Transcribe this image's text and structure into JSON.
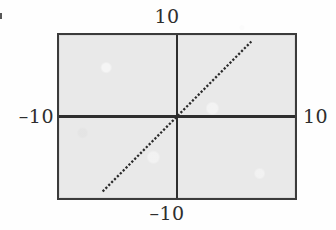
{
  "figure": {
    "kind": "cartesian-line-plot",
    "panel_background_color": "#e9e9e9",
    "frame_color": "#3b3b3b",
    "ink_color": "#2e2e2e",
    "page_background_color": "#fefefe"
  },
  "labels": {
    "top": "10",
    "bottom": "–10",
    "left": "–10",
    "right": "10"
  },
  "chart_data": {
    "type": "line",
    "title": "",
    "subtitle": "",
    "xlabel": "",
    "ylabel": "",
    "xlim": [
      -10,
      10
    ],
    "ylim": [
      -10,
      10
    ],
    "grid": false,
    "legend": false,
    "legend_position": "none",
    "axes_style": "centered-crosshair",
    "x_tick_labels": [
      "–10",
      "10"
    ],
    "y_tick_labels": [
      "–10",
      "10"
    ],
    "x_tick_label_positions": [
      "bottom-center",
      "right-center"
    ],
    "y_tick_label_positions": [
      "left-center",
      "top-center"
    ],
    "line_style": "dotted",
    "line_color": "#2b2b2b",
    "line_width": 2,
    "series": [
      {
        "name": "y = x",
        "comment": "straight dotted line through the origin, slope 1",
        "x": [
          -6.3,
          -4.5,
          -3.0,
          -1.5,
          0.0,
          1.5,
          3.0,
          4.5,
          6.3
        ],
        "y": [
          -9.2,
          -6.6,
          -4.4,
          -2.2,
          0.0,
          2.2,
          4.4,
          6.6,
          9.2
        ]
      }
    ],
    "annotations": []
  }
}
